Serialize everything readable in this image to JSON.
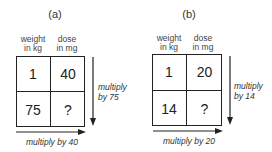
{
  "panels": [
    {
      "label": "(a)",
      "column_headers": [
        "weight\nin kg",
        "dose\nin mg"
      ],
      "col1_header": {
        "line1": "weight",
        "line2": "in kg"
      },
      "col2_header": {
        "line1": "dose",
        "line2": "in mg"
      },
      "cells": [
        [
          "1",
          "40"
        ],
        [
          "75",
          "?"
        ]
      ],
      "vertical_note": {
        "line1": "multiply",
        "line2": "by 75"
      },
      "horizontal_note": "multiply by 40"
    },
    {
      "label": "(b)",
      "column_headers": [
        "weight\nin kg",
        "dose\nin mg"
      ],
      "col1_header": {
        "line1": "weight",
        "line2": "in kg"
      },
      "col2_header": {
        "line1": "dose",
        "line2": "in mg"
      },
      "cells": [
        [
          "1",
          "20"
        ],
        [
          "14",
          "?"
        ]
      ],
      "vertical_note": {
        "line1": "multiply",
        "line2": "by 14"
      },
      "horizontal_note": "multiply by 20"
    }
  ],
  "colors": {
    "line": "#222222",
    "text": "#333333",
    "background": "#ffffff"
  }
}
